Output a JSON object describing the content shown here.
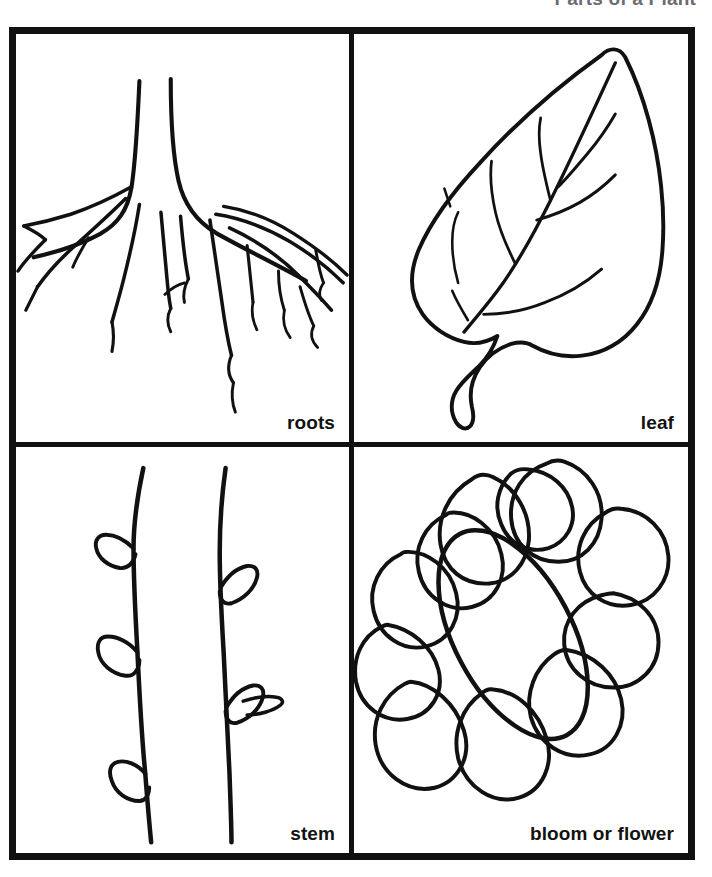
{
  "worksheet": {
    "title": "Parts of a Plant",
    "title_color": "#6b6b73",
    "ink_color": "#111111",
    "background_color": "#ffffff",
    "frame_border_px": 7
  },
  "panels": [
    {
      "id": "roots",
      "position": "top-left",
      "label": "roots",
      "illustration": "root-system-drawing",
      "description": "Branching taproot system with many lateral roots"
    },
    {
      "id": "leaf",
      "position": "top-right",
      "label": "leaf",
      "illustration": "leaf-drawing",
      "description": "Pointed oval leaf with midrib, side veins and petiole"
    },
    {
      "id": "stem",
      "position": "bottom-left",
      "label": "stem",
      "illustration": "stem-drawing",
      "description": "Two vertical stems with small leaf buds"
    },
    {
      "id": "bloom",
      "position": "bottom-right",
      "label": "bloom or flower",
      "illustration": "flower-drawing",
      "description": "Daisy-like bloom with eleven oval petals and tilted oval center"
    }
  ]
}
